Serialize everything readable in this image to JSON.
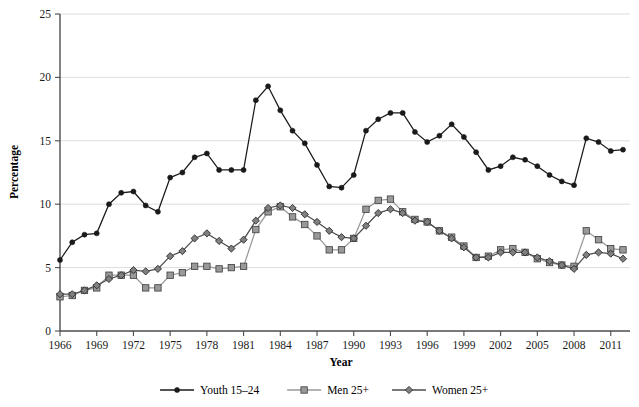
{
  "chart_data": {
    "type": "line",
    "title": "",
    "xlabel": "Year",
    "ylabel": "Percentage",
    "grid": "horizontal",
    "legend_position": "bottom",
    "xlim": [
      1966,
      2012
    ],
    "ylim": [
      0,
      25
    ],
    "y_ticks": [
      "0",
      "5",
      "10",
      "15",
      "20",
      "25"
    ],
    "y_tick_values": [
      0,
      5,
      10,
      15,
      20,
      25
    ],
    "x_ticks": [
      "1966",
      "1969",
      "1972",
      "1975",
      "1978",
      "1981",
      "1984",
      "1987",
      "1990",
      "1993",
      "1996",
      "1999",
      "2002",
      "2005",
      "2008",
      "2011"
    ],
    "x_tick_values": [
      1966,
      1969,
      1972,
      1975,
      1978,
      1981,
      1984,
      1987,
      1990,
      1993,
      1996,
      1999,
      2002,
      2005,
      2008,
      2011
    ],
    "x": [
      1966,
      1967,
      1968,
      1969,
      1970,
      1971,
      1972,
      1973,
      1974,
      1975,
      1976,
      1977,
      1978,
      1979,
      1980,
      1981,
      1982,
      1983,
      1984,
      1985,
      1986,
      1987,
      1988,
      1989,
      1990,
      1991,
      1992,
      1993,
      1994,
      1995,
      1996,
      1997,
      1998,
      1999,
      2000,
      2001,
      2002,
      2003,
      2004,
      2005,
      2006,
      2007,
      2008,
      2009,
      2010,
      2011,
      2012
    ],
    "series": [
      {
        "name": "Youth 15-24",
        "color": "#1a1a1a",
        "marker": "circle",
        "values": [
          5.6,
          7.0,
          7.6,
          7.7,
          10.0,
          10.9,
          11.0,
          9.9,
          9.4,
          12.1,
          12.5,
          13.7,
          14.0,
          12.7,
          12.7,
          12.7,
          18.2,
          19.3,
          17.4,
          15.8,
          14.8,
          13.1,
          11.4,
          11.3,
          12.3,
          15.8,
          16.7,
          17.2,
          17.2,
          15.7,
          14.9,
          15.4,
          16.3,
          15.3,
          14.1,
          12.7,
          13.0,
          13.7,
          13.5,
          13.0,
          12.3,
          11.8,
          11.5,
          15.2,
          14.9,
          14.2,
          14.3
        ]
      },
      {
        "name": "Men 25+",
        "color": "#999999",
        "marker": "square",
        "values": [
          2.7,
          2.8,
          3.2,
          3.4,
          4.4,
          4.4,
          4.4,
          3.4,
          3.4,
          4.4,
          4.6,
          5.1,
          5.1,
          4.9,
          5.0,
          5.1,
          8.0,
          9.4,
          9.8,
          9.0,
          8.4,
          7.5,
          6.4,
          6.4,
          7.3,
          9.6,
          10.3,
          10.4,
          9.4,
          8.8,
          8.6,
          7.9,
          7.4,
          6.7,
          5.8,
          5.9,
          6.4,
          6.5,
          6.2,
          5.7,
          5.4,
          5.2,
          5.1,
          7.9,
          7.2,
          6.5,
          6.4
        ]
      },
      {
        "name": "Women 25+",
        "color": "#4d4d4d",
        "marker": "diamond",
        "values": [
          2.9,
          2.9,
          3.2,
          3.6,
          4.1,
          4.4,
          4.8,
          4.7,
          4.9,
          5.9,
          6.3,
          7.3,
          7.7,
          7.1,
          6.5,
          7.2,
          8.7,
          9.7,
          9.9,
          9.7,
          9.2,
          8.6,
          7.9,
          7.4,
          7.3,
          8.3,
          9.3,
          9.6,
          9.3,
          8.7,
          8.6,
          7.9,
          7.3,
          6.6,
          5.8,
          5.8,
          6.2,
          6.2,
          6.2,
          5.8,
          5.5,
          5.2,
          4.9,
          6.0,
          6.2,
          6.1,
          5.7
        ]
      }
    ]
  },
  "legend": {
    "items": [
      {
        "label": "Youth 15–24"
      },
      {
        "label": "Men 25+"
      },
      {
        "label": "Women 25+"
      }
    ]
  },
  "axes": {
    "x_title": "Year",
    "y_title": "Percentage"
  }
}
